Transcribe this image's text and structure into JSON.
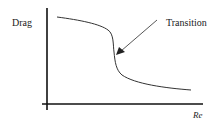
{
  "diagram": {
    "y_label": "Drag",
    "x_label": "Re",
    "annotation": "Transition",
    "colors": {
      "axis": "#111111",
      "curve": "#333333",
      "text": "#222222",
      "background": "#ffffff"
    }
  }
}
